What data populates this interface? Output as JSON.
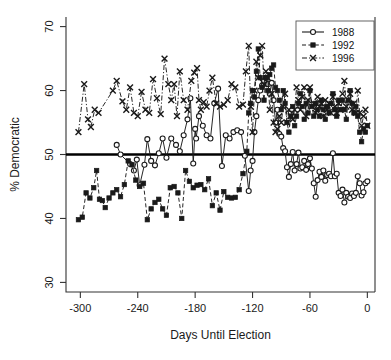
{
  "chart_data": {
    "type": "line",
    "title": "",
    "xlabel": "Days Until Election",
    "ylabel": "% Democratic",
    "xlim": [
      -315,
      8
    ],
    "ylim": [
      28.5,
      71.5
    ],
    "xticks": [
      -300,
      -240,
      -180,
      -120,
      -60,
      0
    ],
    "xtick_labels": [
      "-300",
      "-240",
      "-180",
      "-120",
      "-60",
      "0"
    ],
    "yticks": [
      30,
      40,
      50,
      60,
      70
    ],
    "ytick_labels": [
      "30",
      "40",
      "50",
      "60",
      "70"
    ],
    "grid": false,
    "reference_line": {
      "y": 50,
      "label": "50% line",
      "color": "#000000",
      "width": 2.6
    },
    "legend": {
      "position": "top-right",
      "entries": [
        {
          "name": "1988",
          "marker": "circle",
          "dash": "none",
          "color": "#1a1a1a"
        },
        {
          "name": "1992",
          "marker": "square",
          "dash": "dashed",
          "color": "#1a1a1a"
        },
        {
          "name": "1996",
          "marker": "cross",
          "dash": "dashdot",
          "color": "#1a1a1a"
        }
      ]
    },
    "series": [
      {
        "name": "1988",
        "marker": "circle",
        "dash": "none",
        "color": "#1a1a1a",
        "x": [
          -262,
          -258,
          -248,
          -244,
          -241,
          -238,
          -233,
          -230,
          -226,
          -222,
          -218,
          -214,
          -210,
          -205,
          -200,
          -196,
          -192,
          -188,
          -185,
          -182,
          -180,
          -179,
          -176,
          -172,
          -168,
          -164,
          -160,
          -156,
          -152,
          -148,
          -144,
          -140,
          -136,
          -132,
          -128,
          -124,
          -122,
          -120,
          -118,
          -116,
          -114,
          -112,
          -110,
          -108,
          -106,
          -104,
          -102,
          -100,
          -98,
          -96,
          -94,
          -92,
          -90,
          -88,
          -86,
          -84,
          -82,
          -80,
          -78,
          -76,
          -74,
          -72,
          -70,
          -68,
          -66,
          -64,
          -62,
          -60,
          -58,
          -56,
          -54,
          -52,
          -50,
          -48,
          -46,
          -44,
          -42,
          -40,
          -38,
          -36,
          -34,
          -32,
          -30,
          -28,
          -26,
          -24,
          -22,
          -20,
          -18,
          -16,
          -14,
          -12,
          -10,
          -8,
          -6,
          -4,
          -2,
          0
        ],
        "y": [
          51.5,
          50.0,
          48.5,
          47.5,
          49.2,
          45.2,
          48.4,
          52.4,
          49.0,
          48.3,
          50.2,
          52.5,
          49.5,
          52.5,
          51.5,
          50.5,
          53.0,
          55.5,
          58.8,
          48.6,
          54.0,
          52.5,
          56.0,
          54.5,
          53.0,
          52.5,
          58.0,
          60.3,
          48.2,
          53.0,
          52.5,
          53.5,
          53.8,
          53.5,
          49.8,
          44.3,
          47.5,
          49.0,
          53.5,
          56.0,
          58.5,
          60.0,
          60.8,
          61.5,
          62.0,
          61.0,
          59.5,
          61.2,
          58.5,
          55.0,
          57.0,
          53.2,
          52.8,
          51.0,
          50.5,
          48.0,
          46.5,
          48.5,
          50.4,
          47.5,
          48.5,
          50.3,
          47.8,
          48.0,
          49.0,
          47.6,
          48.5,
          49.4,
          47.8,
          45.5,
          43.4,
          46.0,
          47.3,
          46.5,
          47.5,
          45.9,
          46.8,
          47.0,
          46.6,
          50.2,
          46.6,
          47.0,
          44.0,
          43.5,
          44.5,
          42.5,
          44.0,
          43.4,
          43.2,
          43.9,
          43.5,
          44.0,
          46.6,
          45.5,
          43.6,
          44.1,
          45.5,
          45.8
        ]
      },
      {
        "name": "1992",
        "marker": "square",
        "dash": "dashed",
        "color": "#1a1a1a",
        "x": [
          -302,
          -298,
          -294,
          -290,
          -286,
          -283,
          -280,
          -277,
          -274,
          -270,
          -266,
          -262,
          -258,
          -254,
          -250,
          -246,
          -242,
          -238,
          -234,
          -230,
          -226,
          -222,
          -218,
          -214,
          -210,
          -206,
          -202,
          -198,
          -194,
          -190,
          -186,
          -182,
          -178,
          -174,
          -170,
          -166,
          -162,
          -158,
          -154,
          -150,
          -146,
          -142,
          -138,
          -134,
          -130,
          -126,
          -124,
          -122,
          -120,
          -118,
          -116,
          -114,
          -112,
          -110,
          -108,
          -106,
          -104,
          -102,
          -100,
          -98,
          -96,
          -94,
          -92,
          -90,
          -88,
          -86,
          -84,
          -82,
          -80,
          -78,
          -76,
          -74,
          -72,
          -70,
          -68,
          -66,
          -64,
          -62,
          -60,
          -58,
          -56,
          -54,
          -52,
          -50,
          -48,
          -46,
          -44,
          -42,
          -40,
          -38,
          -36,
          -34,
          -32,
          -30,
          -28,
          -26,
          -24,
          -22,
          -20,
          -18,
          -16,
          -14,
          -12,
          -10,
          -8,
          -6,
          -4,
          -2,
          0
        ],
        "y": [
          39.8,
          40.2,
          44.0,
          43.2,
          44.8,
          47.5,
          43.0,
          42.8,
          41.7,
          43.2,
          44.0,
          44.5,
          43.4,
          45.3,
          49.0,
          48.4,
          46.0,
          45.0,
          45.5,
          39.8,
          41.5,
          42.5,
          43.0,
          41.5,
          40.5,
          44.8,
          45.0,
          44.0,
          40.0,
          47.5,
          45.8,
          44.8,
          45.2,
          45.3,
          44.5,
          46.2,
          42.0,
          44.0,
          41.3,
          44.2,
          43.3,
          43.2,
          43.3,
          44.5,
          47.0,
          50.5,
          56.5,
          58.0,
          60.0,
          59.0,
          63.0,
          66.5,
          62.0,
          60.5,
          58.5,
          62.0,
          60.0,
          62.5,
          63.5,
          64.0,
          60.5,
          60.0,
          58.5,
          57.0,
          60.0,
          58.0,
          55.0,
          53.5,
          56.0,
          57.5,
          54.5,
          56.0,
          58.0,
          59.5,
          57.5,
          55.5,
          58.0,
          56.5,
          60.0,
          57.5,
          56.0,
          58.0,
          57.0,
          56.0,
          58.5,
          57.0,
          55.5,
          57.5,
          56.5,
          58.0,
          59.5,
          57.0,
          56.0,
          58.5,
          57.0,
          58.5,
          57.0,
          55.5,
          58.5,
          60.0,
          58.0,
          56.5,
          57.5,
          56.0,
          53.5,
          52.0,
          54.0,
          53.5,
          54.5
        ]
      },
      {
        "name": "1996",
        "marker": "cross",
        "dash": "dashdot",
        "color": "#1a1a1a",
        "x": [
          -302,
          -296,
          -292,
          -289,
          -285,
          -281,
          -266,
          -262,
          -256,
          -252,
          -248,
          -244,
          -240,
          -236,
          -232,
          -228,
          -224,
          -220,
          -216,
          -212,
          -208,
          -205,
          -202,
          -199,
          -196,
          -192,
          -188,
          -184,
          -181,
          -178,
          -176,
          -174,
          -171,
          -168,
          -165,
          -162,
          -158,
          -154,
          -150,
          -146,
          -142,
          -138,
          -134,
          -130,
          -127,
          -124,
          -122,
          -120,
          -118,
          -116,
          -114,
          -112,
          -110,
          -108,
          -106,
          -104,
          -102,
          -100,
          -98,
          -96,
          -94,
          -92,
          -90,
          -88,
          -86,
          -84,
          -82,
          -80,
          -78,
          -76,
          -74,
          -72,
          -70,
          -68,
          -66,
          -64,
          -62,
          -60,
          -58,
          -56,
          -54,
          -52,
          -50,
          -48,
          -46,
          -44,
          -42,
          -40,
          -38,
          -36,
          -34,
          -32,
          -30,
          -28,
          -26,
          -24,
          -22,
          -20,
          -18,
          -16,
          -14,
          -12,
          -10,
          -8,
          -6,
          -4,
          -2,
          0
        ],
        "y": [
          53.5,
          61.0,
          55.5,
          54.3,
          57.0,
          56.5,
          60.0,
          61.5,
          58.3,
          57.0,
          60.5,
          56.5,
          56.0,
          59.8,
          57.0,
          56.5,
          61.8,
          58.8,
          56.3,
          65.0,
          61.0,
          58.5,
          61.0,
          56.0,
          63.0,
          58.5,
          57.0,
          61.5,
          62.8,
          63.5,
          58.5,
          57.0,
          58.2,
          57.5,
          60.0,
          62.0,
          58.0,
          57.5,
          57.8,
          58.5,
          61.0,
          60.5,
          57.5,
          57.8,
          63.0,
          67.0,
          57.5,
          53.5,
          60.0,
          64.5,
          62.0,
          65.5,
          67.0,
          61.0,
          63.0,
          62.0,
          57.0,
          59.5,
          55.0,
          53.5,
          54.0,
          56.0,
          55.0,
          57.5,
          59.5,
          55.0,
          57.0,
          56.0,
          55.5,
          57.0,
          60.5,
          58.5,
          57.0,
          59.0,
          60.5,
          56.0,
          58.5,
          60.5,
          57.5,
          58.0,
          56.5,
          59.0,
          57.5,
          58.0,
          56.0,
          58.5,
          57.0,
          58.0,
          56.5,
          59.0,
          57.5,
          56.5,
          58.0,
          57.0,
          59.5,
          61.5,
          57.5,
          58.5,
          59.5,
          57.0,
          58.0,
          56.5,
          60.0,
          56.5,
          54.5,
          56.0,
          57.0,
          54.5
        ]
      }
    ]
  }
}
